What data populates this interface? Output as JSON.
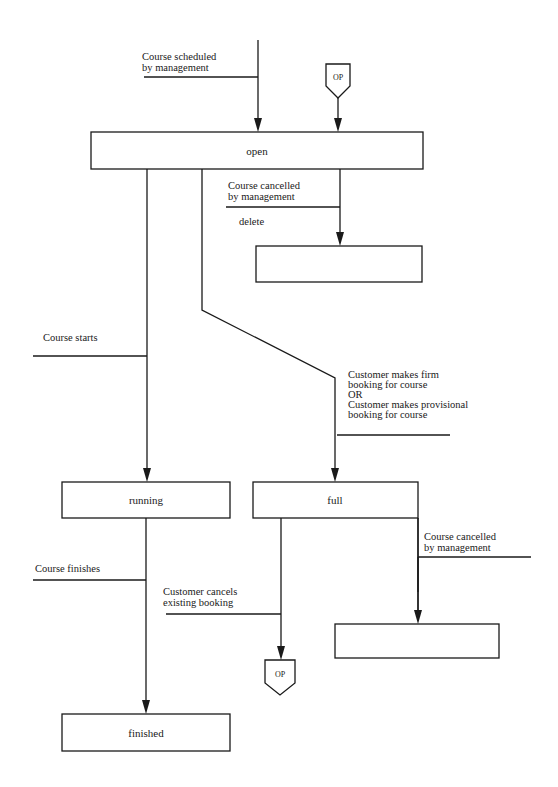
{
  "diagram": {
    "type": "state-transition",
    "states": {
      "open": "open",
      "deleted": "",
      "running": "running",
      "full": "full",
      "finished": "finished",
      "cancelled_full": ""
    },
    "connectors": {
      "op_top": "OP",
      "op_bottom": "OP"
    },
    "events": {
      "scheduled": [
        "Course scheduled",
        "by management"
      ],
      "cancelled_open": [
        "Course cancelled",
        "by management"
      ],
      "delete_action": "delete",
      "starts": "Course starts",
      "booking": [
        "Customer makes firm",
        "booking for course",
        "OR",
        "Customer makes provisional",
        "booking for course"
      ],
      "finishes": "Course finishes",
      "cancels_booking": [
        "Customer cancels",
        "existing booking"
      ],
      "cancelled_full": [
        "Course cancelled",
        "by management"
      ]
    }
  }
}
